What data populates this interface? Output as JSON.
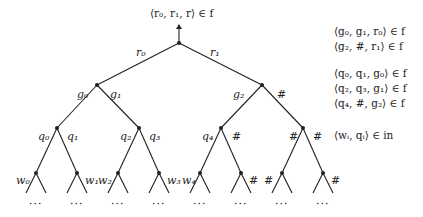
{
  "root_label": "⟨r₀, r₁, r⟩ ∈ f",
  "edges_level1": {
    "left": "r₀",
    "right": "r₁"
  },
  "edges_level2": [
    {
      "left": "g₀",
      "right": "g₁"
    },
    {
      "left": "g₂",
      "right": "#"
    }
  ],
  "edges_level3": [
    {
      "left": "q₀",
      "right": "q₁"
    },
    {
      "left": "q₂",
      "right": "q₃"
    },
    {
      "left": "q₄",
      "right": "#"
    },
    {
      "left": "#",
      "right": "#"
    }
  ],
  "leaf_labels": [
    "w₀",
    "w₁",
    "w₂",
    "w₃",
    "w₄",
    "#",
    "#",
    "#"
  ],
  "ellipsis": "···",
  "rules": [
    "⟨g₀, g₁, r₀⟩ ∈ f",
    "⟨g₂, #, r₁⟩ ∈ f",
    "⟨q₀, q₁, g₀⟩ ∈ f",
    "⟨q₂, q₃, g₁⟩ ∈ f",
    "⟨q₄, #, g₂⟩ ∈ f",
    "⟨wᵢ, qᵢ⟩ ∈ in"
  ]
}
